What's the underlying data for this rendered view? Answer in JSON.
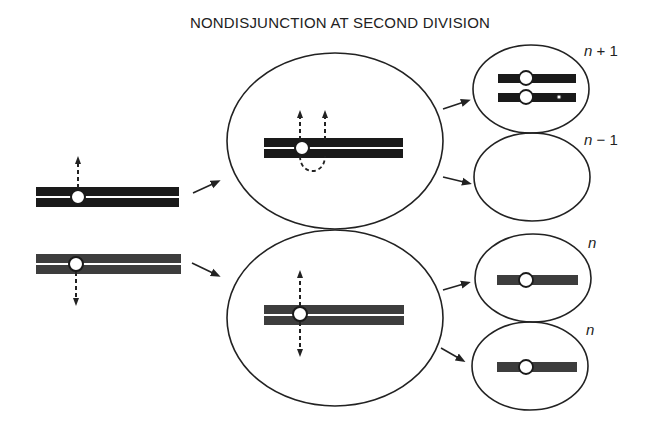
{
  "title": "NONDISJUNCTION AT SECOND DIVISION",
  "colors": {
    "chromosome_black": "#1a1a1a",
    "chromosome_gray": "#3d3d3d",
    "outline": "#222222",
    "background": "#ffffff"
  },
  "stages": [
    {
      "name": "parent-chromosomes",
      "chromosomes": [
        {
          "color": "black",
          "chromatids": 2,
          "spindle": "up"
        },
        {
          "color": "gray",
          "chromatids": 2,
          "spindle": "down"
        }
      ]
    },
    {
      "name": "second-division-cells",
      "cells": [
        {
          "chromosome": "black",
          "event": "nondisjunction",
          "spindle": "both chromatids up"
        },
        {
          "chromosome": "gray",
          "event": "normal",
          "spindle": "up and down"
        }
      ]
    },
    {
      "name": "gametes",
      "cells": [
        {
          "label_var": "n",
          "label_op": "+",
          "label_num": "1",
          "chromosomes": 2,
          "color": "black"
        },
        {
          "label_var": "n",
          "label_op": "−",
          "label_num": "1",
          "chromosomes": 0
        },
        {
          "label_var": "n",
          "label_op": "",
          "label_num": "",
          "chromosomes": 1,
          "color": "gray"
        },
        {
          "label_var": "n",
          "label_op": "",
          "label_num": "",
          "chromosomes": 1,
          "color": "gray"
        }
      ]
    }
  ],
  "labels": {
    "g1": {
      "var": "n",
      "rest": " + 1"
    },
    "g2": {
      "var": "n",
      "rest": " − 1"
    },
    "g3": {
      "var": "n",
      "rest": ""
    },
    "g4": {
      "var": "n",
      "rest": ""
    }
  }
}
